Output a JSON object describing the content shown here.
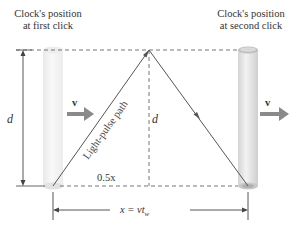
{
  "labels": {
    "first_click_line1": "Clock's position",
    "first_click_line2": "at first click",
    "second_click_line1": "Clock's position",
    "second_click_line2": "at second click",
    "velocity_left": "v",
    "velocity_right": "v",
    "height_left": "d",
    "height_center": "d",
    "light_path": "Light-pulse path",
    "half_distance": "0.5x",
    "distance_x": "x = vt",
    "distance_sub": "w"
  },
  "colors": {
    "line": "#555555",
    "dashed": "#666666",
    "cylinder_light": "#f4f4f4",
    "cylinder_dark": "#d8d8d8",
    "arrow_v": "#888888"
  }
}
